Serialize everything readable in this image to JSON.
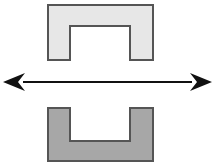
{
  "figure": {
    "title": "Inverted-U and U channel profiles linked by a double-headed arrow",
    "background_color": "#ffffff",
    "width": 217,
    "height": 165
  },
  "shapes": {
    "top_part": {
      "name": "inverted-u-channel",
      "label": "",
      "fill_color": "#e7e7e7",
      "stroke_color": "#555555",
      "stroke_width": 2,
      "outer": {
        "x": 48,
        "y": 5,
        "width": 105,
        "height": 55
      },
      "notch": {
        "x": 70,
        "y": 26,
        "width": 60,
        "height": 34
      },
      "orientation": "opening-down",
      "points": "48,5 153,5 153,60 130,60 130,26 70,26 70,60 48,60"
    },
    "bottom_part": {
      "name": "u-channel",
      "label": "",
      "fill_color": "#a7a7a7",
      "stroke_color": "#555555",
      "stroke_width": 2,
      "outer": {
        "x": 48,
        "y": 108,
        "width": 105,
        "height": 53
      },
      "notch": {
        "x": 70,
        "y": 108,
        "width": 60,
        "height": 33
      },
      "orientation": "opening-up",
      "points": "48,108 70,108 70,141 130,141 130,108 153,108 153,161 48,161"
    }
  },
  "arrow": {
    "name": "double-headed-horizontal-arrow",
    "label": "",
    "color": "#111111",
    "y": 82,
    "x_start": 3,
    "x_end": 212,
    "head_length": 22,
    "head_half_height": 9,
    "shaft_thickness": 2,
    "direction": "both"
  }
}
